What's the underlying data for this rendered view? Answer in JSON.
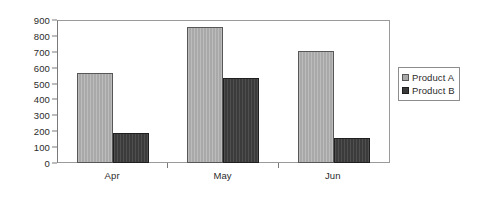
{
  "chart_data": {
    "type": "bar",
    "title": "",
    "subtitle": "",
    "xlabel": "",
    "ylabel": "",
    "categories": [
      "Apr",
      "May",
      "Jun"
    ],
    "series": [
      {
        "name": "Product A",
        "color": "#a9a9a9",
        "values": [
          570,
          860,
          710
        ]
      },
      {
        "name": "Product B",
        "color": "#3b3b3b",
        "values": [
          190,
          540,
          160
        ]
      }
    ],
    "ylim": [
      0,
      900
    ],
    "y_tick_step": 100,
    "y_ticks": [
      0,
      100,
      200,
      300,
      400,
      500,
      600,
      700,
      800,
      900
    ],
    "y_tick_labels": [
      "0",
      "100",
      "200",
      "300",
      "400",
      "500",
      "600",
      "700",
      "800",
      "900"
    ],
    "grid": false,
    "legend_position": "right",
    "legend_entries": [
      "Product A",
      "Product B"
    ],
    "annotations": [],
    "plot_border_color": "#9a9a9a",
    "axis_color": "#7a7a7a",
    "background_color": "#ffffff"
  }
}
